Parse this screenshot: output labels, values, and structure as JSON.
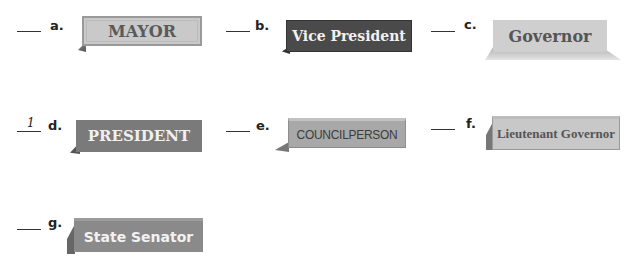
{
  "items": [
    {
      "letter": "a.",
      "answer": "",
      "label": "MAYOR",
      "style": "light serif plate with border"
    },
    {
      "letter": "b.",
      "answer": "",
      "label": "Vice President",
      "style": "dark plate, white serif"
    },
    {
      "letter": "c.",
      "answer": "",
      "label": "Governor",
      "style": "light plate with wide base"
    },
    {
      "letter": "d.",
      "answer": "1",
      "label": "PRESIDENT",
      "style": "medium gray plate, white serif caps"
    },
    {
      "letter": "e.",
      "answer": "",
      "label": "COUNCILPERSON",
      "style": "gray plate, condensed sans caps"
    },
    {
      "letter": "f.",
      "answer": "",
      "label": "Lieutenant Governor",
      "style": "light plate, condensed serif"
    },
    {
      "letter": "g.",
      "answer": "",
      "label": "State Senator",
      "style": "gray plate, white sans"
    }
  ]
}
